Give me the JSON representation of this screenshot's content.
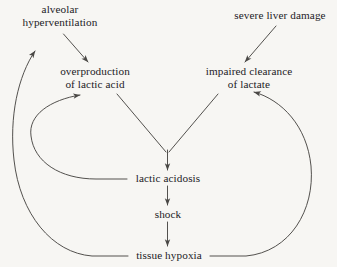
{
  "diagram": {
    "style": {
      "background": "#f7f6f3",
      "line_color": "#4a4845",
      "text_color": "#23211f"
    },
    "nodes": [
      {
        "id": "alveolar-hyperventilation",
        "lines": [
          "alveolar",
          "hyperventilation"
        ],
        "x": 8,
        "y": 3,
        "width": 104
      },
      {
        "id": "severe-liver-damage",
        "lines": [
          "severe liver damage"
        ],
        "x": 226,
        "y": 9,
        "width": 108
      },
      {
        "id": "overproduction-of-lactic-acid",
        "lines": [
          "overproduction",
          "of lactic acid"
        ],
        "x": 48,
        "y": 65,
        "width": 94
      },
      {
        "id": "impaired-clearance-of-lactate",
        "lines": [
          "impaired clearance",
          "of lactate"
        ],
        "x": 196,
        "y": 65,
        "width": 106
      },
      {
        "id": "lactic-acidosis",
        "lines": [
          "lactic acidosis"
        ],
        "x": 129,
        "y": 172,
        "width": 78
      },
      {
        "id": "shock",
        "lines": [
          "shock"
        ],
        "x": 150,
        "y": 208,
        "width": 36
      },
      {
        "id": "tissue-hypoxia",
        "lines": [
          "tissue hypoxia"
        ],
        "x": 130,
        "y": 249,
        "width": 78
      }
    ],
    "edges": [
      {
        "id": "edge-hyperventilation-to-overproduction",
        "from": "alveolar hyperventilation",
        "to": "overproduction of lactic acid",
        "kind": "straight"
      },
      {
        "id": "edge-liver-damage-to-impaired-clearance",
        "from": "severe liver damage",
        "to": "impaired clearance of lactate",
        "kind": "straight"
      },
      {
        "id": "edge-overproduction-to-lactic-acidosis",
        "from": "overproduction of lactic acid",
        "to": "lactic acidosis",
        "kind": "straight"
      },
      {
        "id": "edge-impaired-clearance-to-lactic-acidosis",
        "from": "impaired clearance of lactate",
        "to": "lactic acidosis",
        "kind": "straight"
      },
      {
        "id": "edge-lactic-acidosis-to-shock",
        "from": "lactic acidosis",
        "to": "shock",
        "kind": "straight"
      },
      {
        "id": "edge-shock-to-tissue-hypoxia",
        "from": "shock",
        "to": "tissue hypoxia",
        "kind": "straight"
      },
      {
        "id": "edge-lactic-acidosis-to-overproduction",
        "from": "lactic acidosis",
        "to": "overproduction of lactic acid",
        "kind": "curved-left"
      },
      {
        "id": "edge-tissue-hypoxia-to-hyperventilation",
        "from": "tissue hypoxia",
        "to": "alveolar hyperventilation",
        "kind": "curved-left"
      },
      {
        "id": "edge-tissue-hypoxia-to-impaired-clearance",
        "from": "tissue hypoxia",
        "to": "impaired clearance of lactate",
        "kind": "curved-right"
      }
    ]
  }
}
